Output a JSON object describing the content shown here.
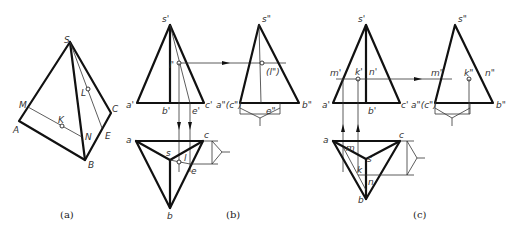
{
  "figure": {
    "panels": [
      {
        "id": "a",
        "caption": "(a)",
        "type": "pictorial-pyramid",
        "vertices": [
          "S",
          "A",
          "B",
          "C"
        ],
        "points": [
          "M",
          "K",
          "N",
          "L",
          "E"
        ]
      },
      {
        "id": "b",
        "caption": "(b)",
        "type": "three-view-projection",
        "front_view_labels": [
          "s'",
          "l'",
          "a'",
          "b'",
          "e'",
          "c'"
        ],
        "side_view_labels": [
          "s\"",
          "(l\")",
          "a\"(c\")",
          "e\"",
          "b\""
        ],
        "top_view_labels": [
          "a",
          "s",
          "l",
          "c",
          "e",
          "b"
        ]
      },
      {
        "id": "c",
        "caption": "(c)",
        "type": "three-view-projection",
        "front_view_labels": [
          "s'",
          "m'",
          "k'",
          "n'",
          "a'",
          "b'",
          "c'"
        ],
        "side_view_labels": [
          "s\"",
          "m\"",
          "k\"",
          "n\"",
          "a\"(c\")",
          "b\""
        ],
        "top_view_labels": [
          "a",
          "m",
          "s",
          "k",
          "n",
          "c",
          "b"
        ]
      }
    ],
    "labels": {
      "a_S": "S",
      "a_M": "M",
      "a_A": "A",
      "a_K": "K",
      "a_N": "N",
      "a_L": "L",
      "a_C": "C",
      "a_E": "E",
      "a_B": "B",
      "b_s1": "s'",
      "b_l1": "l'",
      "b_a1": "a'",
      "b_b1": "b'",
      "b_e1": "e'",
      "b_c1": "c'",
      "b_s2": "s\"",
      "b_l2": "(l\")",
      "b_ac2": "a\"(c\")",
      "b_e2": "e\"",
      "b_b2": "b\"",
      "b_a": "a",
      "b_s": "s",
      "b_l": "l",
      "b_c": "c",
      "b_e": "e",
      "b_b": "b",
      "c_s1": "s'",
      "c_m1": "m'",
      "c_k1": "k'",
      "c_n1": "n'",
      "c_a1": "a'",
      "c_b1": "b'",
      "c_c1": "c'",
      "c_s2": "s\"",
      "c_m2": "m\"",
      "c_k2": "k\"",
      "c_n2": "n\"",
      "c_ac2": "a\"(c\")",
      "c_b2": "b\"",
      "c_a": "a",
      "c_m": "m",
      "c_s": "s",
      "c_k": "k",
      "c_n": "n",
      "c_c": "c",
      "c_b": "b"
    },
    "captions": {
      "a": "(a)",
      "b": "(b)",
      "c": "(c)"
    }
  }
}
